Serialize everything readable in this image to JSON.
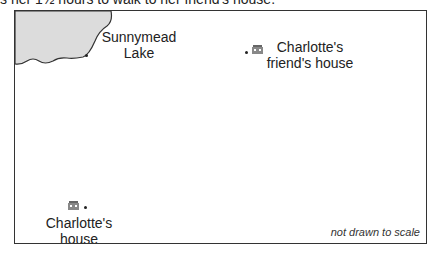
{
  "caption": "s her 1½ hours to walk to her friend's house.",
  "map": {
    "lake": {
      "name": "Sunnymead Lake",
      "line1": "Sunnymead",
      "line2": "Lake",
      "fill": "#dcdcdc"
    },
    "friend_house": {
      "line1": "Charlotte's",
      "line2": "friend's house"
    },
    "home": {
      "line1": "Charlotte's",
      "line2": "house"
    },
    "note": "not drawn to scale"
  }
}
